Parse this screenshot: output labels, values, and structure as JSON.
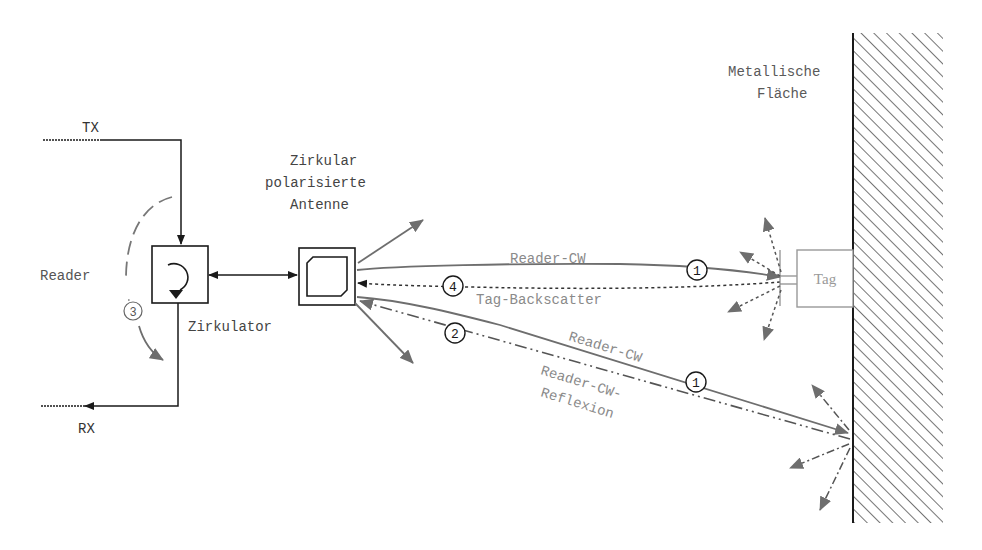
{
  "diagram": {
    "labels": {
      "tx": "TX",
      "rx": "RX",
      "reader": "Reader",
      "circulator": "Zirkulator",
      "antenna_line1": "Zirkular",
      "antenna_line2": "polarisierte",
      "antenna_line3": "Antenne",
      "metal_line1": "Metallische",
      "metal_line2": "Fläche",
      "tag": "Tag",
      "reader_cw_top": "Reader-CW",
      "tag_backscatter": "Tag-Backscatter",
      "reader_cw_bottom": "Reader-CW",
      "reflexion_line1": "Reader-CW-",
      "reflexion_line2": "Reflexion"
    },
    "markers": {
      "m1_top": "1",
      "m1_bottom": "1",
      "m2": "2",
      "m3": "3",
      "m4": "4"
    },
    "colors": {
      "black": "#1a1a1a",
      "gray_line": "#6e6e6e",
      "gray_text": "#8a8a8a",
      "hatch": "#3a3a3a"
    }
  }
}
